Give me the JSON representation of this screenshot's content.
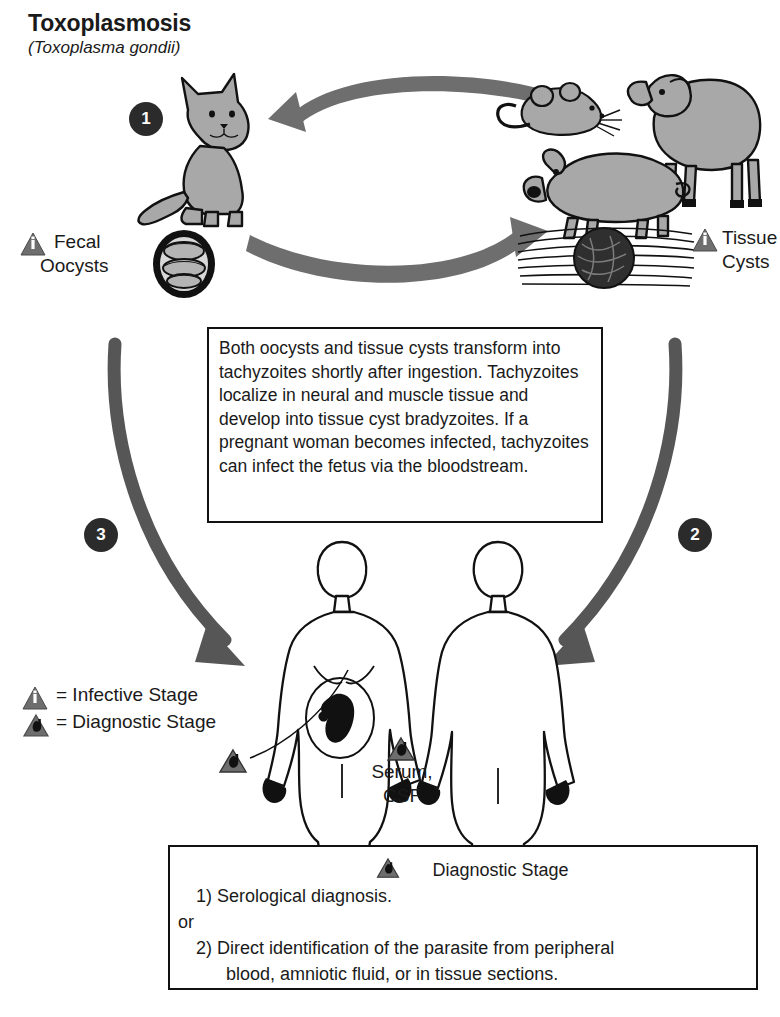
{
  "title": "Toxoplasmosis",
  "subtitle": "(Toxoplasma gondii)",
  "colors": {
    "arrow_gray": "#6e6e6e",
    "animal_fill": "#a8a8a8",
    "badge_dark": "#2b2b2b",
    "outline": "#111111",
    "background": "#ffffff"
  },
  "stages": {
    "one": "1",
    "two": "2",
    "three": "3"
  },
  "labels": {
    "fecal_oocysts_line1": "Fecal",
    "fecal_oocysts_line2": "Oocysts",
    "tissue_cysts_line1": "Tissue",
    "tissue_cysts_line2": "Cysts",
    "serum_line1": "Serum,",
    "serum_line2": "CSF"
  },
  "legend": {
    "infective": "= Infective Stage",
    "diagnostic": "= Diagnostic Stage",
    "infective_marker": "i",
    "diagnostic_marker": "d"
  },
  "infobox": {
    "text": "Both oocysts and tissue cysts transform into tachyzoites shortly after ingestion. Tachyzoites localize in neural and muscle tissue and develop into tissue cyst bradyzoites. If a pregnant woman becomes infected, tachyzoites can infect the fetus via the bloodstream."
  },
  "diagnostic_box": {
    "heading": "Diagnostic Stage",
    "item1": "1) Serological diagnosis.",
    "connector": "or",
    "item2": "2) Direct identification of the parasite from peripheral",
    "item2_cont": "blood, amniotic fluid, or in tissue sections."
  },
  "organisms": {
    "cat": "cat",
    "mouse": "mouse",
    "sheep": "sheep",
    "pig": "pig",
    "oocyst": "oocyst",
    "tissue_cyst": "tissue-cyst",
    "pregnant_woman": "pregnant-woman",
    "man": "man",
    "fetus": "fetus"
  }
}
